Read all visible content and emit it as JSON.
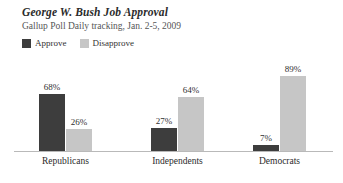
{
  "header": {
    "title": "George W. Bush Job Approval",
    "subtitle": "Gallup Poll Daily tracking, Jan. 2-5, 2009"
  },
  "legend": {
    "items": [
      {
        "label": "Approve",
        "color": "#3d3d3d"
      },
      {
        "label": "Disapprove",
        "color": "#c6c6c6"
      }
    ]
  },
  "chart_data": {
    "type": "bar",
    "title": "George W. Bush Job Approval",
    "subtitle": "Gallup Poll Daily tracking, Jan. 2-5, 2009",
    "xlabel": "",
    "ylabel": "",
    "ylim": [
      0,
      100
    ],
    "grid": false,
    "legend_position": "top-left",
    "categories": [
      "Republicans",
      "Independents",
      "Democrats"
    ],
    "series": [
      {
        "name": "Approve",
        "color": "#3d3d3d",
        "values": [
          68,
          27,
          7
        ],
        "labels": [
          "68%",
          "27%",
          "7%"
        ]
      },
      {
        "name": "Disapprove",
        "color": "#c6c6c6",
        "values": [
          26,
          64,
          89
        ],
        "labels": [
          "26%",
          "64%",
          "89%"
        ]
      }
    ]
  }
}
